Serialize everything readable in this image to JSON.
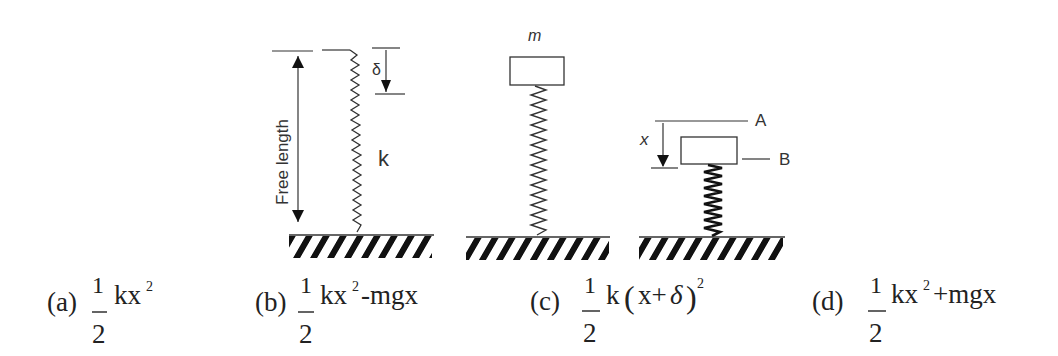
{
  "figures": {
    "free_spring": {
      "free_length_label": "Free length",
      "delta_label": "δ",
      "stiffness_label": "k"
    },
    "loaded_spring": {
      "mass_label": "m"
    },
    "compressed_spring": {
      "displacement_label": "x",
      "position_a_label": "A",
      "position_b_label": "B"
    }
  },
  "options": [
    {
      "id": "a",
      "label": "(a)",
      "numerator": "1",
      "denominator": "2",
      "expr_pre": "kx",
      "exp": "2",
      "expr_post": ""
    },
    {
      "id": "b",
      "label": "(b)",
      "numerator": "1",
      "denominator": "2",
      "expr_pre": "kx",
      "exp": "2",
      "expr_post": "-mgx"
    },
    {
      "id": "c",
      "label": "(c)",
      "numerator": "1",
      "denominator": "2",
      "expr_pre": "k",
      "paren_open": "(",
      "inner": "x+",
      "inner_sym": "δ",
      "paren_close": ")",
      "exp": "2",
      "expr_post": ""
    },
    {
      "id": "d",
      "label": "(d)",
      "numerator": "1",
      "denominator": "2",
      "expr_pre": "kx",
      "exp": "2",
      "expr_post": "+mgx"
    }
  ],
  "colors": {
    "ink": "#222222",
    "line": "#444444"
  }
}
